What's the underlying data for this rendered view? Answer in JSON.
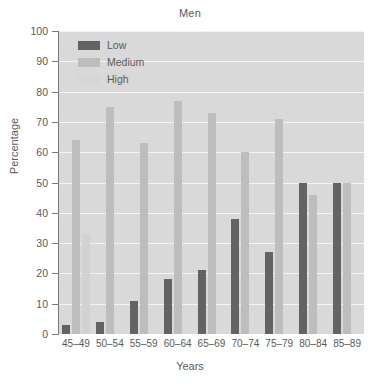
{
  "chart_data": {
    "type": "bar",
    "title": "Men",
    "xlabel": "Years",
    "ylabel": "Percentage",
    "categories": [
      "45–49",
      "50–54",
      "55–59",
      "60–64",
      "65–69",
      "70–74",
      "75–79",
      "80–84",
      "85–89"
    ],
    "series": [
      {
        "name": "Low",
        "color": "#636363",
        "values": [
          3,
          4,
          11,
          18,
          21,
          38,
          27,
          50,
          50
        ]
      },
      {
        "name": "Medium",
        "color": "#bdbdbd",
        "values": [
          64,
          75,
          63,
          77,
          73,
          60,
          71,
          46,
          50
        ]
      },
      {
        "name": "High",
        "color": "#d2d2d2",
        "values": [
          33,
          0,
          0,
          0,
          0,
          0,
          0,
          0,
          0
        ]
      }
    ],
    "ylim": [
      0,
      100
    ],
    "yticks": [
      0,
      10,
      20,
      30,
      40,
      50,
      60,
      70,
      80,
      90,
      100
    ],
    "ytick_labels": [
      "0",
      "10",
      "20",
      "30",
      "40",
      "50",
      "60",
      "70",
      "80",
      "90",
      "100"
    ],
    "grid": true,
    "grid_color": "#f4f4f4",
    "plot_background": "#d9d9d9",
    "legend_position": "top-left"
  }
}
